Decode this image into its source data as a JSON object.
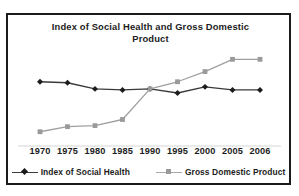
{
  "figure": {
    "title": "Index of Social Health and Gross Domestic Product",
    "frame_color": "#1b1b1b",
    "background": "#ffffff"
  },
  "chart_data": {
    "type": "line",
    "title": "Index of Social Health and Gross Domestic Product",
    "xlabel": "",
    "ylabel": "",
    "grid": false,
    "legend_position": "bottom",
    "categories": [
      "1970",
      "1975",
      "1980",
      "1985",
      "1990",
      "1995",
      "2000",
      "2005",
      "2006"
    ],
    "x": [
      1970,
      1975,
      1980,
      1985,
      1990,
      1995,
      2000,
      2005,
      2006
    ],
    "ylim": [
      0,
      100
    ],
    "axis_ticks_shown": true,
    "y_axis_labels_shown": false,
    "series": [
      {
        "name": "Index of Social Health",
        "color": "#3a3a3a",
        "marker": "diamond",
        "marker_color": "#1c1c1c",
        "values": [
          62,
          61,
          55,
          54,
          55,
          51,
          57,
          54,
          54
        ]
      },
      {
        "name": "Gross Domestic Product",
        "color": "#a0a0a0",
        "marker": "square",
        "marker_color": "#9a9a9a",
        "values": [
          13,
          18,
          19,
          25,
          55,
          62,
          72,
          84,
          84
        ]
      }
    ]
  },
  "x_axis": {
    "tick_labels": [
      "1970",
      "1975",
      "1980",
      "1985",
      "1990",
      "1995",
      "2000",
      "2005",
      "2006"
    ],
    "axis_line_color": "#d5d5d5"
  },
  "legend": {
    "items": [
      {
        "label": "Index of Social Health",
        "marker": "diamond",
        "color": "#1c1c1c",
        "line_color": "#3a3a3a"
      },
      {
        "label": "Gross Domestic Product",
        "marker": "square",
        "color": "#9a9a9a",
        "line_color": "#a8a8a8"
      }
    ]
  }
}
